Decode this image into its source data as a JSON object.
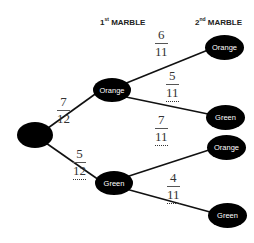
{
  "headers": {
    "first": {
      "num": "1",
      "sup": "st",
      "label": " MARBLE"
    },
    "second": {
      "num": "2",
      "sup": "nd",
      "label": " MARBLE"
    }
  },
  "nodes": {
    "root": {
      "label": ""
    },
    "first_orange": {
      "label": "Orange"
    },
    "first_green": {
      "label": "Green"
    },
    "orange_orange": {
      "label": "Orange"
    },
    "orange_green": {
      "label": "Green"
    },
    "green_orange": {
      "label": "Orange"
    },
    "green_green": {
      "label": "Green"
    }
  },
  "probabilities": {
    "root_orange": {
      "num": "7",
      "den": "12",
      "dotted": false
    },
    "root_green": {
      "num": "5",
      "den": "12",
      "dotted": true
    },
    "orange_orange": {
      "num": "6",
      "den": "11",
      "dotted": false
    },
    "orange_green": {
      "num": "5",
      "den": "11",
      "dotted": true
    },
    "green_orange": {
      "num": "7",
      "den": "11",
      "dotted": true
    },
    "green_green": {
      "num": "4",
      "den": "11",
      "dotted": true
    }
  },
  "colors": {
    "node_fill": "#000000",
    "node_text": "#ffffff",
    "line": "#111111"
  }
}
